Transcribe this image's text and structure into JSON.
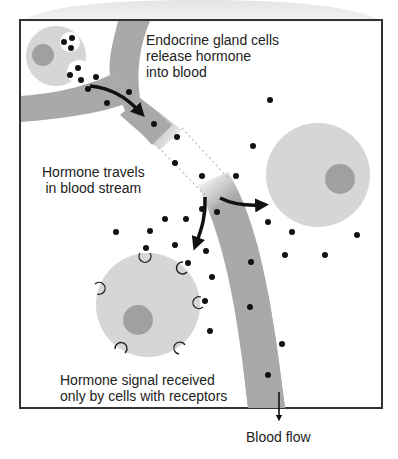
{
  "diagram": {
    "labels": {
      "release": "Endocrine gland cells\nrelease hormone\ninto blood",
      "travels": "Hormone travels\nin blood stream",
      "received": "Hormone signal received\nonly by cells with receptors",
      "blood_flow": "Blood flow"
    },
    "colors": {
      "vessel": "#a9a9a9",
      "cell": "#d6d6d6",
      "nucleus": "#a0a0a0",
      "hormone": "#111111",
      "border": "#333333",
      "header_shade": "#ececec"
    },
    "elements": {
      "gland_cell": "endocrine-gland-cell",
      "target_cell_no_receptor": "non-target-cell",
      "target_cell_with_receptors": "target-cell",
      "vessel": "blood-vessel"
    }
  }
}
